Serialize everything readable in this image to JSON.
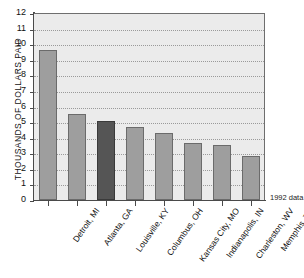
{
  "chart_data": {
    "type": "bar",
    "title": "",
    "xlabel": "",
    "ylabel": "THOUSANDS OF DOLLARS PAID",
    "ylim": [
      0,
      12
    ],
    "ytick_labels": [
      "12",
      "11",
      "10",
      "9",
      "8",
      "7",
      "6",
      "5",
      "4",
      "3",
      "2",
      "1",
      "0"
    ],
    "ytick_values": [
      12,
      11,
      10,
      9,
      8,
      7,
      6,
      5,
      4,
      3,
      2,
      1,
      0
    ],
    "grid": true,
    "legend": "none",
    "annotation": "1992 data",
    "categories": [
      "Detroit, MI",
      "Atlanta, GA",
      "Louisville, KY",
      "Columbus, OH",
      "Kansas City, MO",
      "Indianapolis, IN",
      "Charleston, WV",
      "Memphis, TN"
    ],
    "values": [
      9.65,
      5.55,
      5.1,
      4.7,
      4.3,
      3.65,
      3.5,
      2.85
    ],
    "highlight_index": 2,
    "colors": {
      "bar": "#9e9e9e",
      "bar_highlight": "#555555",
      "bar_border": "#6b6b6b",
      "plot_background": "#ebebeb",
      "axis": "#4a4a4a",
      "gridline": "#9a9a9a"
    }
  }
}
